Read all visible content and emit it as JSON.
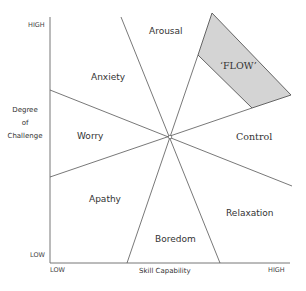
{
  "axes": {
    "y": {
      "high_label": "HIGH",
      "low_label": "LOW",
      "title_line1": "Degree",
      "title_line2": "of",
      "title_line3": "Challenge"
    },
    "x": {
      "low_label": "LOW",
      "high_label": "HIGH",
      "title": "Skill Capability"
    }
  },
  "regions": {
    "arousal": "Arousal",
    "anxiety": "Anxiety",
    "worry": "Worry",
    "apathy": "Apathy",
    "boredom": "Boredom",
    "relaxation": "Relaxation",
    "control": "Control",
    "flow": "‘FLOW’"
  },
  "colors": {
    "line": "#555555",
    "axis": "#777777",
    "flow_fill": "#d4d4d4"
  }
}
